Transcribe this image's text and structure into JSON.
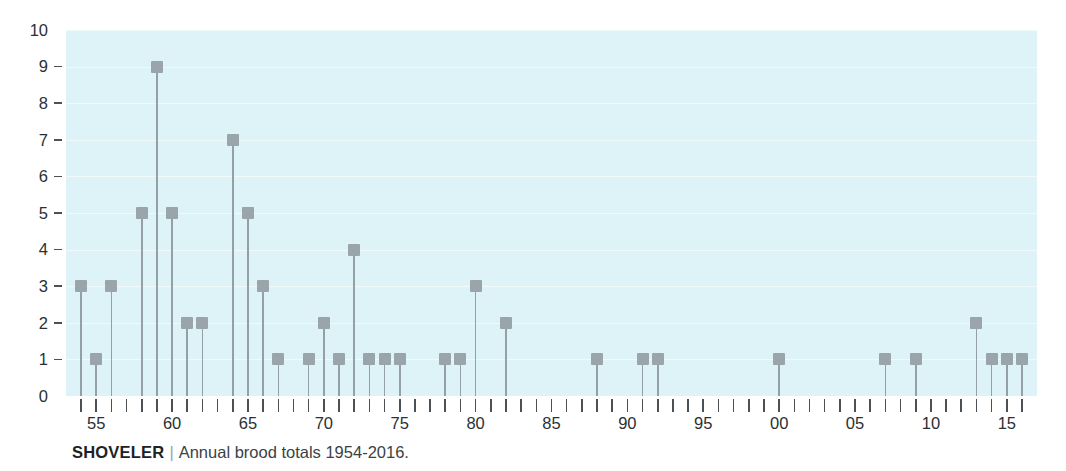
{
  "caption": {
    "species": "SHOVELER",
    "separator": "|",
    "description": "Annual brood totals 1954-2016."
  },
  "colors": {
    "plot_background": "#ddf3f7",
    "marker": "#9aa5ab",
    "stem": "#93a0a8",
    "axis_text": "#2b3034",
    "page_background": "#ffffff"
  },
  "chart_data": {
    "type": "bar",
    "title": "",
    "subtitle": "",
    "xlabel": "",
    "ylabel": "",
    "ylim": [
      0,
      10
    ],
    "xlim": [
      1954,
      2016
    ],
    "grid": true,
    "legend": null,
    "ytick_labels": [
      "0",
      "1",
      "2",
      "3",
      "4",
      "5",
      "6",
      "7",
      "8",
      "9",
      "10"
    ],
    "ytick_values": [
      0,
      1,
      2,
      3,
      4,
      5,
      6,
      7,
      8,
      9,
      10
    ],
    "xtick_labels": [
      "55",
      "60",
      "65",
      "70",
      "75",
      "80",
      "85",
      "90",
      "95",
      "00",
      "05",
      "10",
      "15"
    ],
    "xtick_values": [
      1955,
      1960,
      1965,
      1970,
      1975,
      1980,
      1985,
      1990,
      1995,
      2000,
      2005,
      2010,
      2015
    ],
    "categories": [
      1954,
      1955,
      1956,
      1957,
      1958,
      1959,
      1960,
      1961,
      1962,
      1963,
      1964,
      1965,
      1966,
      1967,
      1968,
      1969,
      1970,
      1971,
      1972,
      1973,
      1974,
      1975,
      1976,
      1977,
      1978,
      1979,
      1980,
      1981,
      1982,
      1983,
      1984,
      1985,
      1986,
      1987,
      1988,
      1989,
      1990,
      1991,
      1992,
      1993,
      1994,
      1995,
      1996,
      1997,
      1998,
      1999,
      2000,
      2001,
      2002,
      2003,
      2004,
      2005,
      2006,
      2007,
      2008,
      2009,
      2010,
      2011,
      2012,
      2013,
      2014,
      2015,
      2016
    ],
    "values": [
      3,
      1,
      3,
      0,
      5,
      9,
      5,
      2,
      2,
      0,
      7,
      5,
      3,
      1,
      0,
      1,
      2,
      1,
      4,
      1,
      1,
      1,
      0,
      0,
      1,
      1,
      3,
      0,
      2,
      0,
      0,
      0,
      0,
      0,
      1,
      0,
      0,
      1,
      1,
      0,
      0,
      0,
      0,
      0,
      0,
      0,
      1,
      0,
      0,
      0,
      0,
      0,
      0,
      1,
      0,
      1,
      0,
      0,
      0,
      2,
      1,
      1,
      1
    ]
  }
}
